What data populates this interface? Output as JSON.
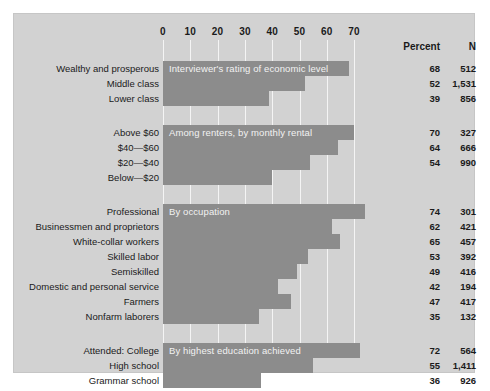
{
  "chart_data": {
    "type": "bar",
    "title": "",
    "xlabel": "",
    "ylabel": "",
    "xlim": [
      0,
      70
    ],
    "grid": true,
    "orientation": "horizontal",
    "tick_labels": [
      "0",
      "10",
      "20",
      "30",
      "40",
      "50",
      "60",
      "70"
    ],
    "ticks": [
      0,
      10,
      20,
      30,
      40,
      50,
      60,
      70
    ],
    "value_columns": [
      "Percent",
      "N"
    ],
    "groups": [
      {
        "title": "Interviewer's rating of economic level",
        "categories": [
          "Wealthy and prosperous",
          "Middle class",
          "Lower class"
        ],
        "values": [
          68,
          52,
          39
        ],
        "n": [
          "512",
          "1,531",
          "856"
        ]
      },
      {
        "title": "Among renters, by monthly rental",
        "categories": [
          "Above $60",
          "$40—$60",
          "$20—$40",
          "Below—$20"
        ],
        "values": [
          70,
          64,
          54,
          40
        ],
        "n": [
          "327",
          "666",
          "990",
          ""
        ]
      },
      {
        "title": "By occupation",
        "categories": [
          "Professional",
          "Businessmen and proprietors",
          "White-collar workers",
          "Skilled labor",
          "Semiskilled",
          "Domestic and personal service",
          "Farmers",
          "Nonfarm laborers"
        ],
        "values": [
          74,
          62,
          65,
          53,
          49,
          42,
          47,
          35
        ],
        "n": [
          "301",
          "421",
          "457",
          "392",
          "416",
          "194",
          "417",
          "132"
        ]
      },
      {
        "title": "By highest education achieved",
        "categories": [
          "Attended: College",
          "High school",
          "Grammar school"
        ],
        "values": [
          72,
          55,
          36
        ],
        "n": [
          "564",
          "1,411",
          "926"
        ]
      }
    ]
  },
  "colors": {
    "background": "#d2d2d2",
    "bar": "#8c8c8c",
    "gridline": "#f4f4f4",
    "text": "#1a1a1a",
    "bar_title_text": "#f2f2f2"
  },
  "axis": {
    "tick0": "0",
    "tick1": "10",
    "tick2": "20",
    "tick3": "30",
    "tick4": "40",
    "tick5": "50",
    "tick6": "60",
    "tick7": "70"
  },
  "headers": {
    "percent": "Percent",
    "n": "N"
  }
}
